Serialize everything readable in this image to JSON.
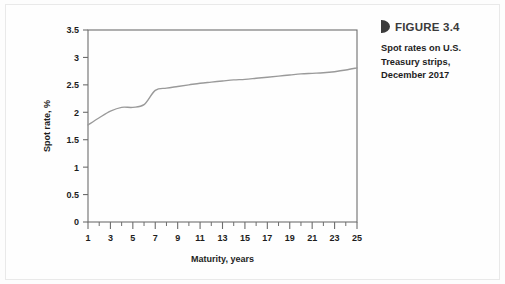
{
  "figure": {
    "marker_icon": "triangle-marker-icon",
    "title": "FIGURE 3.4",
    "caption_lines": [
      "Spot rates on U.S.",
      "Treasury strips,",
      "December 2017"
    ]
  },
  "colors": {
    "curve": "#9a9a9a",
    "axis": "#6d6d6d",
    "text": "#1d1d1d",
    "title": "#3b3b3b",
    "background": "#fefefe"
  },
  "chart_data": {
    "type": "line",
    "title": "",
    "xlabel": "Maturity, years",
    "ylabel": "Spot rate, %",
    "xlim": [
      1,
      25
    ],
    "ylim": [
      0,
      3.5
    ],
    "grid": false,
    "legend": "none",
    "x_ticks": [
      1,
      3,
      5,
      7,
      9,
      11,
      13,
      15,
      17,
      19,
      21,
      23,
      25
    ],
    "x_tick_labels": [
      "1",
      "3",
      "5",
      "7",
      "9",
      "11",
      "13",
      "15",
      "17",
      "19",
      "21",
      "23",
      "25"
    ],
    "x_minor_ticks": [
      2,
      4,
      6,
      8,
      10,
      12,
      14,
      16,
      18,
      20,
      22,
      24
    ],
    "y_ticks": [
      0,
      0.5,
      1,
      1.5,
      2,
      2.5,
      3,
      3.5
    ],
    "y_tick_labels": [
      "0",
      "0.5",
      "1",
      "1.5",
      "2",
      "2.5",
      "3",
      "3.5"
    ],
    "series": [
      {
        "name": "Spot rate",
        "x": [
          1,
          2,
          3,
          4,
          5,
          6,
          7,
          8,
          9,
          10,
          11,
          12,
          13,
          14,
          15,
          16,
          17,
          18,
          19,
          20,
          21,
          22,
          23,
          24,
          25
        ],
        "values": [
          1.77,
          1.9,
          2.02,
          2.09,
          2.09,
          2.14,
          2.4,
          2.44,
          2.47,
          2.5,
          2.53,
          2.55,
          2.57,
          2.59,
          2.6,
          2.62,
          2.64,
          2.66,
          2.68,
          2.7,
          2.71,
          2.72,
          2.74,
          2.77,
          2.81
        ]
      }
    ]
  }
}
